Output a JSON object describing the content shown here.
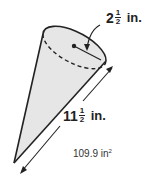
{
  "figure": {
    "shape": "cone",
    "radius_label": {
      "whole": "2",
      "numerator": "1",
      "denominator": "2",
      "unit": "in."
    },
    "slant_height_label": {
      "whole": "11",
      "numerator": "1",
      "denominator": "2",
      "unit": "in."
    },
    "surface_area_label": {
      "value": "109.9 in",
      "exponent": "2"
    },
    "colors": {
      "fill": "#e6e6e6",
      "stroke": "#222222"
    }
  }
}
